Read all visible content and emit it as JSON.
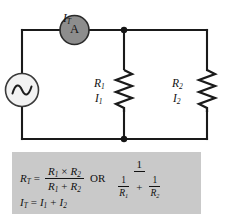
{
  "figure": {
    "background_color": "#ffffff",
    "wire_color": "#1a1a1a"
  },
  "circuit": {
    "source": {
      "name": "ac-voltage-source",
      "symbol": "sine-wave-in-circle",
      "fill_color": "#f2f2f2"
    },
    "meter": {
      "name": "ammeter",
      "letter": "A",
      "fill_color": "#8d8d8d",
      "current_label": "I",
      "current_subscript": "T"
    },
    "branches": [
      {
        "resistor_label": "R",
        "resistor_subscript": "1",
        "current_label": "I",
        "current_subscript": "1"
      },
      {
        "resistor_label": "R",
        "resistor_subscript": "2",
        "current_label": "I",
        "current_subscript": "2"
      }
    ],
    "nodes": [
      "top-junction",
      "bottom-junction"
    ]
  },
  "formula_box": {
    "background_color": "#c9c9c9",
    "equation_total_resistance": {
      "lhs": "R",
      "lhs_subscript": "T",
      "equals": "=",
      "numerator_left": "R",
      "numerator_left_subscript": "1",
      "times": "×",
      "numerator_right": "R",
      "numerator_right_subscript": "2",
      "denominator_left": "R",
      "denominator_left_subscript": "1",
      "plus": "+",
      "denominator_right": "R",
      "denominator_right_subscript": "2",
      "or_word": "OR",
      "alt_numerator": "1",
      "alt_den_first_num": "1",
      "alt_den_first_den": "R",
      "alt_den_first_den_subscript": "1",
      "alt_den_plus": "+",
      "alt_den_second_num": "1",
      "alt_den_second_den": "R",
      "alt_den_second_den_subscript": "2"
    },
    "equation_total_current": {
      "lhs": "I",
      "lhs_subscript": "T",
      "equals": "=",
      "term1": "I",
      "term1_subscript": "1",
      "plus": "+",
      "term2": "I",
      "term2_subscript": "2"
    }
  }
}
